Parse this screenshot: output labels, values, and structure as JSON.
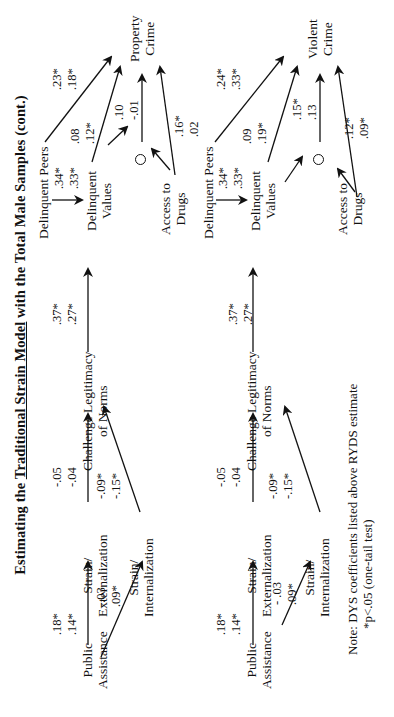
{
  "title": {
    "prefix": "Estimating the ",
    "underlined": "Traditional Strain Model",
    "suffix": " with the Total Male Samples (cont.)"
  },
  "orientation": "rotated 90 degrees counter-clockwise",
  "panels": [
    {
      "id": "property",
      "outcome": {
        "line1": "Property",
        "line2": "Crime"
      },
      "nodes": {
        "public_assistance": {
          "line1": "Public",
          "line2": "Assistance"
        },
        "strain_externalization": {
          "line1": "Strain/",
          "line2": "Externalization"
        },
        "strain_internalization": {
          "line1": "Strain/",
          "line2": "Internalization"
        },
        "challenge_norms": {
          "line1": "Challenge Legitimacy",
          "line2": "of Norms"
        },
        "delinquent_peers": {
          "line1": "Delinquent Peers"
        },
        "delinquent_values": {
          "line1": "Delinquent",
          "line2": "Values"
        },
        "access_drugs": {
          "line1": "Access to",
          "line2": "Drugs"
        }
      },
      "paths": {
        "pa_to_ext": {
          "dys": ".18*",
          "ryds": ".14*"
        },
        "pa_to_int": {
          "dys": "-.03",
          "ryds": ".09*"
        },
        "ext_to_challenge": {
          "dys": "-.05",
          "ryds": "-.04"
        },
        "int_to_challenge": {
          "dys": "-.09*",
          "ryds": "-.15*"
        },
        "challenge_to_values": {
          "dys": ".37*",
          "ryds": ".27*"
        },
        "peers_to_values": {
          "dys": ".34*",
          "ryds": ".33*"
        },
        "peers_to_crime": {
          "dys": ".23*",
          "ryds": ".18*"
        },
        "values_to_crime": {
          "dys": ".08",
          "ryds": ".12*"
        },
        "interaction_to_crime": {
          "dys": ".10",
          "ryds": "-.01"
        },
        "drugs_to_crime": {
          "dys": ".16*",
          "ryds": ".02"
        }
      }
    },
    {
      "id": "violent",
      "outcome": {
        "line1": "Violent",
        "line2": "Crime"
      },
      "nodes": {
        "public_assistance": {
          "line1": "Public",
          "line2": "Assistance"
        },
        "strain_externalization": {
          "line1": "Strain/",
          "line2": "Externalization"
        },
        "strain_internalization": {
          "line1": "Strain/",
          "line2": "Internalization"
        },
        "challenge_norms": {
          "line1": "Challenge Legitimacy",
          "line2": "of Norms"
        },
        "delinquent_peers": {
          "line1": "Delinquent Peers"
        },
        "delinquent_values": {
          "line1": "Delinquent",
          "line2": "Values"
        },
        "access_drugs": {
          "line1": "Access to",
          "line2": "Drugs"
        }
      },
      "paths": {
        "pa_to_ext": {
          "dys": ".18*",
          "ryds": ".14*"
        },
        "pa_to_int": {
          "dys": "- .03",
          "ryds": ".09*"
        },
        "ext_to_challenge": {
          "dys": "-.05",
          "ryds": "-.04"
        },
        "int_to_challenge": {
          "dys": "-.09*",
          "ryds": "-.15*"
        },
        "challenge_to_values": {
          "dys": ".37*",
          "ryds": ".27*"
        },
        "peers_to_values": {
          "dys": ".34*",
          "ryds": ".33*"
        },
        "peers_to_crime": {
          "dys": ".24*",
          "ryds": ".33*"
        },
        "values_to_crime": {
          "dys": ".09",
          "ryds": ".19*"
        },
        "interaction_to_crime": {
          "dys": ".15*",
          "ryds": ".13"
        },
        "drugs_to_crime": {
          "dys": ".12*",
          "ryds": ".09*"
        }
      }
    }
  ],
  "note": {
    "line1": "Note: DYS coefficients listed above RYDS estimate",
    "line2": "*p<.05 (one-tail test)"
  },
  "colors": {
    "ink": "#111111",
    "background": "#ffffff"
  }
}
